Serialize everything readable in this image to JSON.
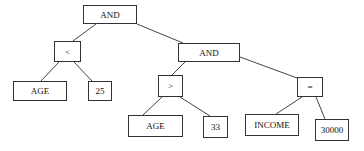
{
  "diagram": {
    "type": "expression-tree",
    "nodes": [
      {
        "id": "and-root",
        "label": "AND",
        "x": 83,
        "y": 5,
        "w": 54,
        "h": 19
      },
      {
        "id": "lt",
        "label": "<",
        "x": 54,
        "y": 41,
        "w": 27,
        "h": 21
      },
      {
        "id": "and-right",
        "label": "AND",
        "x": 178,
        "y": 43,
        "w": 62,
        "h": 19
      },
      {
        "id": "age-1",
        "label": "AGE",
        "x": 13,
        "y": 81,
        "w": 54,
        "h": 20
      },
      {
        "id": "val-25",
        "label": "25",
        "x": 88,
        "y": 81,
        "w": 24,
        "h": 20
      },
      {
        "id": "gt",
        "label": ">",
        "x": 158,
        "y": 75,
        "w": 25,
        "h": 22
      },
      {
        "id": "eq",
        "label": "=",
        "x": 297,
        "y": 77,
        "w": 26,
        "h": 20
      },
      {
        "id": "age-2",
        "label": "AGE",
        "x": 128,
        "y": 115,
        "w": 55,
        "h": 22
      },
      {
        "id": "val-33",
        "label": "33",
        "x": 203,
        "y": 116,
        "w": 25,
        "h": 22
      },
      {
        "id": "income",
        "label": "INCOME",
        "x": 245,
        "y": 114,
        "w": 54,
        "h": 22
      },
      {
        "id": "val-30000",
        "label": "30000",
        "x": 315,
        "y": 119,
        "w": 34,
        "h": 22
      }
    ],
    "edges": [
      {
        "from": "and-root",
        "to": "lt",
        "x1": 96,
        "y1": 24,
        "x2": 73,
        "y2": 41
      },
      {
        "from": "and-root",
        "to": "and-right",
        "x1": 137,
        "y1": 24,
        "x2": 183,
        "y2": 43
      },
      {
        "from": "lt",
        "to": "age-1",
        "x1": 59,
        "y1": 62,
        "x2": 41,
        "y2": 81
      },
      {
        "from": "lt",
        "to": "val-25",
        "x1": 74,
        "y1": 62,
        "x2": 92,
        "y2": 81
      },
      {
        "from": "and-right",
        "to": "gt",
        "x1": 185,
        "y1": 62,
        "x2": 172,
        "y2": 75
      },
      {
        "from": "and-right",
        "to": "eq",
        "x1": 240,
        "y1": 57,
        "x2": 297,
        "y2": 78
      },
      {
        "from": "gt",
        "to": "age-2",
        "x1": 162,
        "y1": 97,
        "x2": 143,
        "y2": 115
      },
      {
        "from": "gt",
        "to": "val-33",
        "x1": 180,
        "y1": 97,
        "x2": 210,
        "y2": 116
      },
      {
        "from": "eq",
        "to": "income",
        "x1": 302,
        "y1": 97,
        "x2": 276,
        "y2": 114
      },
      {
        "from": "eq",
        "to": "val-30000",
        "x1": 316,
        "y1": 97,
        "x2": 325,
        "y2": 119
      }
    ],
    "colors": {
      "line": "#333333",
      "box_border": "#333333",
      "background": "#ffffff"
    }
  }
}
